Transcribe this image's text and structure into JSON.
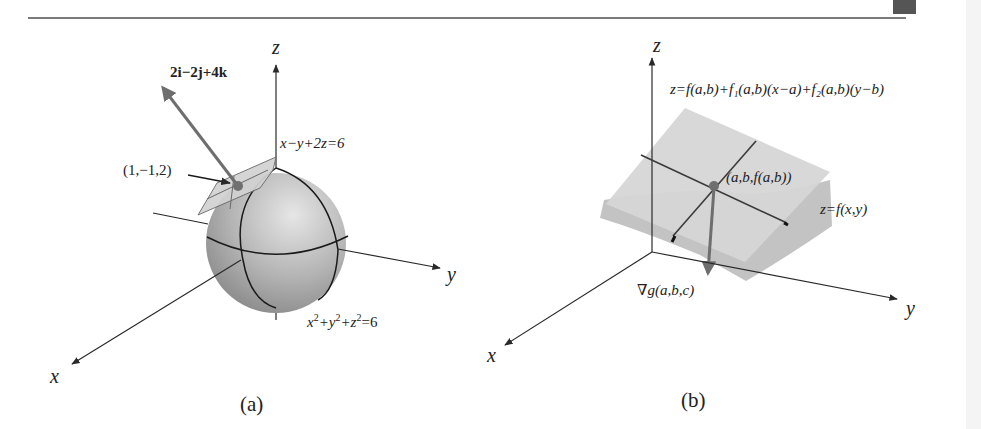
{
  "figure": {
    "panels": [
      {
        "id": "a",
        "caption": "(a)",
        "axes": {
          "x": "x",
          "y": "y",
          "z": "z"
        },
        "normal_vector_label": "2i−2j+4k",
        "normal_vector_parts": [
          "2",
          "i",
          "−2",
          "j",
          "+4",
          "k"
        ],
        "point_label": "(1,−1,2)",
        "plane_label": "x−y+2z=6",
        "sphere_label": "x²+y²+z²=6",
        "sphere_label_parts": [
          "x",
          "2",
          "+y",
          "2",
          "+z",
          "2",
          "=6"
        ]
      },
      {
        "id": "b",
        "caption": "(b)",
        "axes": {
          "x": "x",
          "y": "y",
          "z": "z"
        },
        "tangent_plane_label": "z=f(a,b)+f₁(a,b)(x−a)+f₂(a,b)(y−b)",
        "point_label": "(a,b,f(a,b))",
        "surface_label": "z=f(x,y)",
        "gradient_label": "∇g(a,b,c)"
      }
    ],
    "colors": {
      "axis": "#2a2a2a",
      "sphere_light": "#d8d8d8",
      "sphere_dark": "#8c8c8c",
      "plane_fill": "#d6d6d6",
      "vector": "#6e6e6e",
      "point": "#707070",
      "surface": "#bdbdbd"
    }
  }
}
